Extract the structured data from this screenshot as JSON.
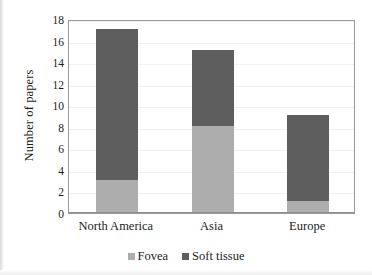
{
  "chart_data": {
    "type": "bar",
    "subtype": "stacked-vertical-bar",
    "title": "",
    "xlabel": "",
    "ylabel": "Number of papers",
    "categories": [
      "North America",
      "Asia",
      "Europe"
    ],
    "series": [
      {
        "name": "Fovea",
        "values": [
          3,
          8,
          1
        ],
        "color": "#adadad"
      },
      {
        "name": "Soft tissue",
        "values": [
          14,
          7,
          8
        ],
        "color": "#5e5e5e"
      }
    ],
    "totals": [
      17,
      15,
      9
    ],
    "ylim": [
      0,
      18
    ],
    "ytick_step": 2,
    "yticks": [
      0,
      2,
      4,
      6,
      8,
      10,
      12,
      14,
      16,
      18
    ],
    "ytick_labels": [
      "0",
      "2",
      "4",
      "6",
      "8",
      "10",
      "12",
      "14",
      "16",
      "18"
    ],
    "grid": true,
    "grid_axis": "y",
    "legend_position": "bottom-center",
    "legend_entries": [
      "Fovea",
      "Soft tissue"
    ],
    "plot_border": true
  },
  "colors": {
    "fovea": "#adadad",
    "soft_tissue": "#5e5e5e",
    "border": "#9a9a9a",
    "gridline": "#f0f0f0",
    "text": "#1c1c1c",
    "background": "#ffffff"
  }
}
